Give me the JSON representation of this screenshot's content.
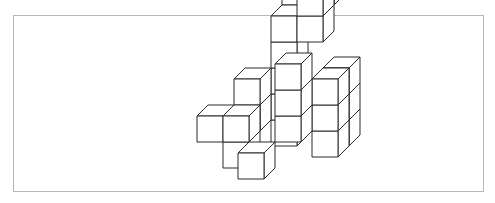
{
  "figure": {
    "title": "",
    "frame_color": "#b8b8b8",
    "line_color": "#2a2a2a",
    "fill_color": "#ffffff",
    "cube": {
      "w": 26,
      "h": 26,
      "dx": 11,
      "dy": -11
    },
    "origin": {
      "x": 212,
      "y": 179
    },
    "cubes": [
      {
        "x": 3,
        "y": 2,
        "z": 3
      },
      {
        "x": 3,
        "y": 1,
        "z": 3
      },
      {
        "x": 3,
        "y": 0,
        "z": 3
      },
      {
        "x": 3,
        "y": 2,
        "z": 2
      },
      {
        "x": 3,
        "y": 1,
        "z": 2
      },
      {
        "x": 3,
        "y": 0,
        "z": 2
      },
      {
        "x": 1,
        "y": 5,
        "z": 4
      },
      {
        "x": 2,
        "y": 5,
        "z": 4
      },
      {
        "x": 1,
        "y": 4,
        "z": 3
      },
      {
        "x": 1,
        "y": 3,
        "z": 3
      },
      {
        "x": 1,
        "y": 2,
        "z": 3
      },
      {
        "x": 1,
        "y": 1,
        "z": 3
      },
      {
        "x": 1,
        "y": 0,
        "z": 3
      },
      {
        "x": 2,
        "y": 5,
        "z": 3
      },
      {
        "x": 2,
        "y": 4,
        "z": 3
      },
      {
        "x": 0,
        "y": 2,
        "z": 2
      },
      {
        "x": 0,
        "y": 1,
        "z": 2
      },
      {
        "x": -1,
        "y": 1,
        "z": 1
      },
      {
        "x": 0,
        "y": 0,
        "z": 1
      },
      {
        "x": 0,
        "y": 1,
        "z": 1
      },
      {
        "x": 2,
        "y": 3,
        "z": 1
      },
      {
        "x": 2,
        "y": 2,
        "z": 1
      },
      {
        "x": 2,
        "y": 1,
        "z": 1
      },
      {
        "x": 1,
        "y": 0,
        "z": 0
      }
    ]
  }
}
